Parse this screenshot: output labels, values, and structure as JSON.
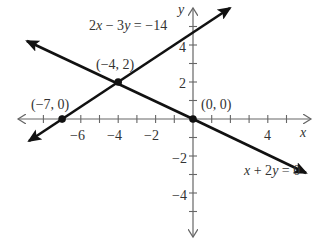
{
  "chart_data": {
    "type": "line",
    "title": "",
    "xlabel": "x",
    "ylabel": "y",
    "xlim": [
      -9.5,
      6.5
    ],
    "ylim": [
      -6,
      6
    ],
    "grid": false,
    "x_ticks": [
      -8,
      -7,
      -6,
      -5,
      -4,
      -3,
      -2,
      -1,
      1,
      2,
      3,
      4,
      5,
      6
    ],
    "x_tick_labels": [
      "-6",
      "-4",
      "-2",
      "4"
    ],
    "y_ticks": [
      -5,
      -4,
      -3,
      -2,
      -1,
      1,
      2,
      3,
      4,
      5
    ],
    "y_tick_labels": [
      "4",
      "2",
      "-2",
      "-4"
    ],
    "series": [
      {
        "name": "2x − 3y = −14",
        "equation": "2x - 3y = -14",
        "slope": 0.6667,
        "intercept": 4.6667
      },
      {
        "name": "x + 2y = 0",
        "equation": "x + 2y = 0",
        "slope": -0.5,
        "intercept": 0
      }
    ],
    "points": [
      {
        "label": "(−4, 2)",
        "x": -4,
        "y": 2
      },
      {
        "label": "(−7, 0)",
        "x": -7,
        "y": 0
      },
      {
        "label": "(0, 0)",
        "x": 0,
        "y": 0
      }
    ]
  },
  "labels": {
    "eq1": "2x − 3y = −14",
    "eq2": "x + 2y = 0",
    "p1": "(−4, 2)",
    "p2": "(−7, 0)",
    "p3": "(0, 0)",
    "xaxis": "x",
    "yaxis": "y",
    "xt_m6": "−6",
    "xt_m4": "−4",
    "xt_m2": "−2",
    "xt_4": "4",
    "yt_4": "4",
    "yt_2": "2",
    "yt_m2": "−2",
    "yt_m4": "−4"
  }
}
